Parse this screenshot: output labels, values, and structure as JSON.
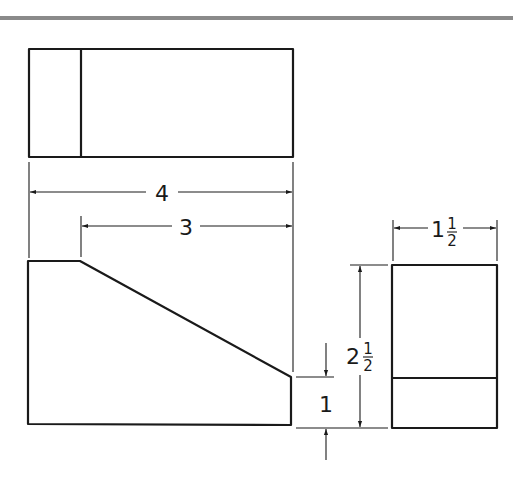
{
  "drawing": {
    "type": "orthographic-projection",
    "views": [
      "top-view",
      "front-view",
      "right-side-view"
    ],
    "stroke_color": "#1a1a1a",
    "header_bar_color": "#8a8a8a"
  },
  "dimensions": {
    "overall_width": {
      "label": "4"
    },
    "slope_width": {
      "label": "3"
    },
    "depth": {
      "whole": "1",
      "num": "1",
      "den": "2"
    },
    "height": {
      "whole": "2",
      "num": "1",
      "den": "2"
    },
    "low_height": {
      "label": "1"
    }
  }
}
